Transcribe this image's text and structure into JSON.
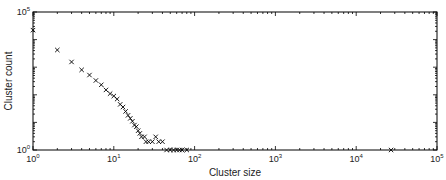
{
  "chart_data": {
    "type": "scatter",
    "title": "",
    "xlabel": "Cluster size",
    "ylabel": "Cluster count",
    "xscale": "log",
    "yscale": "log",
    "xlim": [
      1,
      100000
    ],
    "ylim": [
      1,
      100000
    ],
    "x_ticks": [
      "10^0",
      "10^1",
      "10^2",
      "10^3",
      "10^4",
      "10^5"
    ],
    "y_ticks": [
      "10^0",
      "10^5"
    ],
    "marker": "x",
    "grid": false,
    "legend": null,
    "series": [
      {
        "name": "clusters",
        "points": [
          [
            1,
            22000
          ],
          [
            2,
            4200
          ],
          [
            3,
            1550
          ],
          [
            4,
            800
          ],
          [
            5,
            520
          ],
          [
            6,
            330
          ],
          [
            7,
            230
          ],
          [
            8,
            150
          ],
          [
            9,
            110
          ],
          [
            10,
            90
          ],
          [
            11,
            70
          ],
          [
            12,
            45
          ],
          [
            13,
            36
          ],
          [
            14,
            25
          ],
          [
            15,
            18
          ],
          [
            16,
            14
          ],
          [
            17,
            11
          ],
          [
            18,
            8
          ],
          [
            19,
            7
          ],
          [
            20,
            5
          ],
          [
            21,
            4
          ],
          [
            22,
            3
          ],
          [
            24,
            3
          ],
          [
            25,
            2
          ],
          [
            27,
            2
          ],
          [
            30,
            2
          ],
          [
            33,
            3
          ],
          [
            36,
            2
          ],
          [
            40,
            2
          ],
          [
            45,
            1
          ],
          [
            50,
            1
          ],
          [
            55,
            1
          ],
          [
            60,
            1
          ],
          [
            65,
            1
          ],
          [
            70,
            1
          ],
          [
            80,
            1
          ],
          [
            27000,
            1
          ]
        ]
      }
    ]
  },
  "labels": {
    "xlabel": "Cluster size",
    "ylabel": "Cluster count"
  }
}
